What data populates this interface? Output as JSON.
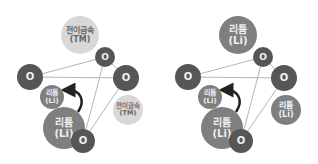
{
  "colors": {
    "oxygen": "#565656",
    "lithium": "#7f7f7f",
    "transition_metal": "#d8d8d8",
    "bond_line": "#b5b5b5",
    "arrow": "#222222"
  },
  "left_diagram": {
    "tm_top": {
      "line1": "전이금속",
      "line2": "(TM)"
    },
    "o_top": {
      "label": "O"
    },
    "o_left": {
      "label": "O"
    },
    "o_right": {
      "label": "O"
    },
    "li_small": {
      "line1": "리튬",
      "line2": "(Li)"
    },
    "li_big": {
      "line1": "리튬",
      "line2": "(Li)"
    },
    "o_bottom": {
      "label": "O"
    },
    "tm_right": {
      "line1": "전이금속",
      "line2": "(TM)"
    }
  },
  "right_diagram": {
    "li_top": {
      "line1": "리튬",
      "line2": "(Li)"
    },
    "o_top": {
      "label": "O"
    },
    "o_left": {
      "label": "O"
    },
    "o_right": {
      "label": "O"
    },
    "li_small": {
      "line1": "리튬",
      "line2": "(Li)"
    },
    "li_big": {
      "line1": "리튬",
      "line2": "(Li)"
    },
    "o_bottom": {
      "label": "O"
    },
    "li_right": {
      "line1": "리튬",
      "line2": "(Li)"
    }
  }
}
